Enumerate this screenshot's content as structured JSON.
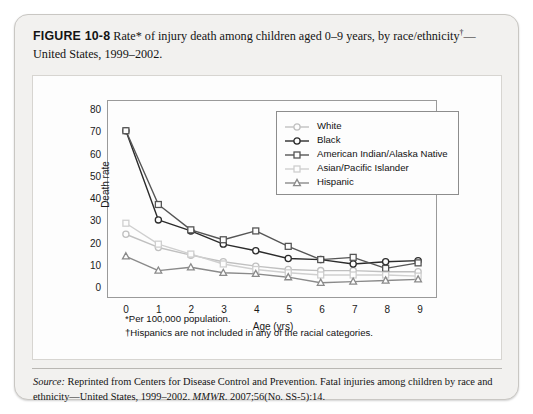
{
  "caption": {
    "figure_number": "FIGURE 10-8",
    "text_before_dagger": "Rate* of injury death among children aged 0–9 years, by race/ethnicity",
    "dagger": "†",
    "text_after_dagger": "—United States, 1999–2002."
  },
  "footnotes": {
    "asterisk": "*Per 100,000 population.",
    "dagger": "†Hispanics are not included in any of the racial categories."
  },
  "source": {
    "label": "Source:",
    "text_part1": " Reprinted from Centers for Disease Control and Prevention. Fatal injuries among children by race and ethnicity—United States, 1999–2002. ",
    "journal": "MMWR.",
    "text_part2": " 2007;56(No. SS-5):14."
  },
  "chart_data": {
    "type": "line",
    "title": "",
    "xlabel": "Age (yrs)",
    "ylabel": "Death rate",
    "x": [
      0,
      1,
      2,
      3,
      4,
      5,
      6,
      7,
      8,
      9
    ],
    "xticklabels": [
      "0",
      "1",
      "2",
      "3",
      "4",
      "5",
      "6",
      "7",
      "8",
      "9"
    ],
    "yticklabels": [
      "0",
      "10",
      "20",
      "30",
      "40",
      "50",
      "60",
      "70",
      "80"
    ],
    "xlim": [
      0,
      9
    ],
    "ylim": [
      0,
      80
    ],
    "ytick_step": 10,
    "grid": false,
    "legend_position": "top-center-inside",
    "series": [
      {
        "name": "White",
        "marker": "circle",
        "color": "#c0c0c0",
        "values": [
          24.0,
          18.0,
          14.5,
          11.5,
          9.5,
          8.0,
          7.5,
          7.5,
          7.0,
          7.0
        ]
      },
      {
        "name": "Black",
        "marker": "circle",
        "color": "#2b2b2b",
        "values": [
          71.0,
          30.5,
          25.5,
          19.5,
          16.5,
          13.0,
          12.5,
          10.5,
          11.5,
          12.0
        ]
      },
      {
        "name": "American Indian/Alaska Native",
        "marker": "square",
        "color": "#555555",
        "values": [
          71.0,
          37.5,
          26.0,
          21.5,
          25.5,
          18.5,
          12.5,
          13.5,
          8.5,
          11.0
        ]
      },
      {
        "name": "Asian/Pacific Islander",
        "marker": "square",
        "color": "#cfcfcf",
        "values": [
          29.0,
          19.5,
          15.0,
          10.5,
          8.0,
          6.5,
          5.5,
          5.5,
          5.5,
          5.0
        ]
      },
      {
        "name": "Hispanic",
        "marker": "triangle",
        "color": "#8a8a8a",
        "values": [
          14.0,
          7.5,
          9.0,
          6.5,
          6.0,
          4.5,
          2.0,
          2.5,
          3.0,
          3.5
        ]
      }
    ]
  }
}
